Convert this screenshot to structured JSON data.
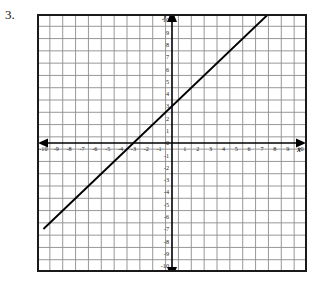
{
  "problem": {
    "number": "3."
  },
  "chart_data": {
    "type": "line",
    "title": "",
    "xlabel": "x",
    "ylabel": "y",
    "grid": true,
    "legend": false,
    "xlim": [
      -10.5,
      10.5
    ],
    "ylim": [
      -10.5,
      10.5
    ],
    "xticks": [
      -10,
      -9,
      -8,
      -7,
      -6,
      -5,
      -4,
      -3,
      -2,
      -1,
      1,
      2,
      3,
      4,
      5,
      6,
      7,
      8,
      9,
      10
    ],
    "yticks": [
      10,
      9,
      8,
      7,
      6,
      5,
      4,
      3,
      2,
      1,
      0,
      -1,
      -2,
      -3,
      -4,
      -5,
      -6,
      -7,
      -8,
      -9,
      -10
    ],
    "xtick_labels": [
      "-10",
      "-9",
      "-8",
      "-7",
      "-6",
      "-5",
      "-4",
      "-3",
      "-2",
      "-1",
      "1",
      "2",
      "3",
      "4",
      "5",
      "6",
      "7",
      "8",
      "9",
      "10"
    ],
    "ytick_labels": [
      "10",
      "9",
      "8",
      "7",
      "6",
      "5",
      "4",
      "3",
      "2",
      "1",
      "0",
      "-1",
      "-2",
      "-3",
      "-4",
      "-5",
      "-6",
      "-7",
      "-8",
      "-9",
      "-10"
    ],
    "series": [
      {
        "name": "line",
        "slope": 1,
        "intercept": 3,
        "x_intercept": -3,
        "y_intercept": 3,
        "points": [
          [
            -10,
            -7
          ],
          [
            8,
            11
          ]
        ],
        "color": "#000000"
      }
    ],
    "colors": {
      "line": "#000000",
      "grid": "#8c8c8c",
      "axis": "#000000",
      "frame": "#1a1a1a",
      "background": "#ffffff"
    }
  }
}
